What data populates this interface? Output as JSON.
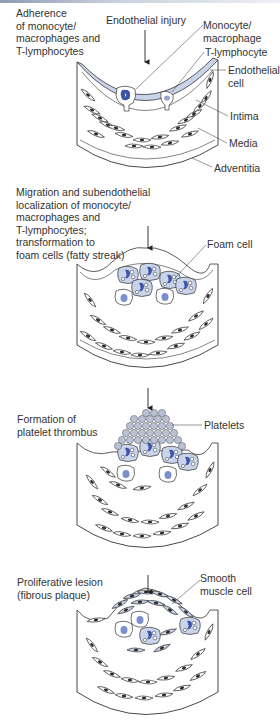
{
  "figure": {
    "colors": {
      "accent_blue": "#3d55a8",
      "pale_blue": "#c9d3ea",
      "platelet": "#b9c1d4",
      "ink": "#2a2a2a"
    }
  },
  "stages": [
    {
      "caption": [
        "Adherence",
        "of monocyte/",
        "macrophages and",
        "T-lymphocytes"
      ],
      "arrow_label": "Endothelial injury",
      "labels": {
        "monocyte": [
          "Monocyte/",
          "macrophage"
        ],
        "tlymph": "T-lymphocyte",
        "endo": [
          "Endothelial",
          "cell"
        ],
        "intima": "Intima",
        "media": "Media",
        "adventitia": "Adventitia"
      }
    },
    {
      "caption": [
        "Migration and subendothelial",
        "localization of monocyte/",
        "macrophages and",
        "T-lymphocytes;",
        "transformation to",
        "foam cells (fatty streak)"
      ],
      "labels": {
        "foam": "Foam cell"
      }
    },
    {
      "caption": [
        "Formation of",
        "platelet thrombus"
      ],
      "labels": {
        "platelets": "Platelets"
      }
    },
    {
      "caption": [
        "Proliferative lesion",
        "(fibrous plaque)"
      ],
      "labels": {
        "smc": [
          "Smooth",
          "muscle cell"
        ]
      }
    }
  ]
}
